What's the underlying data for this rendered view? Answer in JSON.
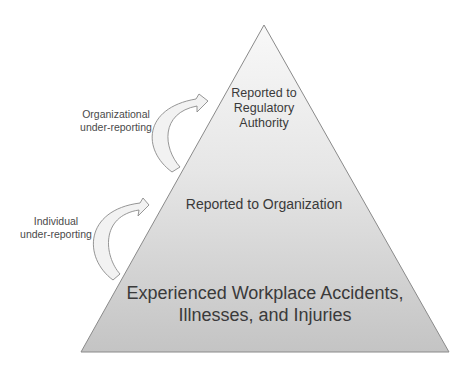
{
  "diagram": {
    "type": "pyramid",
    "colors": {
      "pyramid_top": "#f7f7f7",
      "pyramid_bottom": "#c6c6c6",
      "pyramid_stroke": "#8a8a8a",
      "arrow_fill": "#f2f2f2",
      "arrow_stroke": "#8a8a8a",
      "text": "#3a3a3a"
    },
    "tiers": [
      {
        "id": "regulatory",
        "lines": [
          "Reported to",
          "Regulatory",
          "Authority"
        ]
      },
      {
        "id": "organization",
        "lines": [
          "Reported to Organization"
        ]
      },
      {
        "id": "experienced",
        "lines": [
          "Experienced Workplace Accidents,",
          "Illnesses, and Injuries"
        ]
      }
    ],
    "arrows": [
      {
        "id": "organizational",
        "lines": [
          "Organizational",
          "under-reporting"
        ],
        "from": "organization",
        "to": "regulatory"
      },
      {
        "id": "individual",
        "lines": [
          "Individual",
          "under-reporting"
        ],
        "from": "experienced",
        "to": "organization"
      }
    ]
  }
}
